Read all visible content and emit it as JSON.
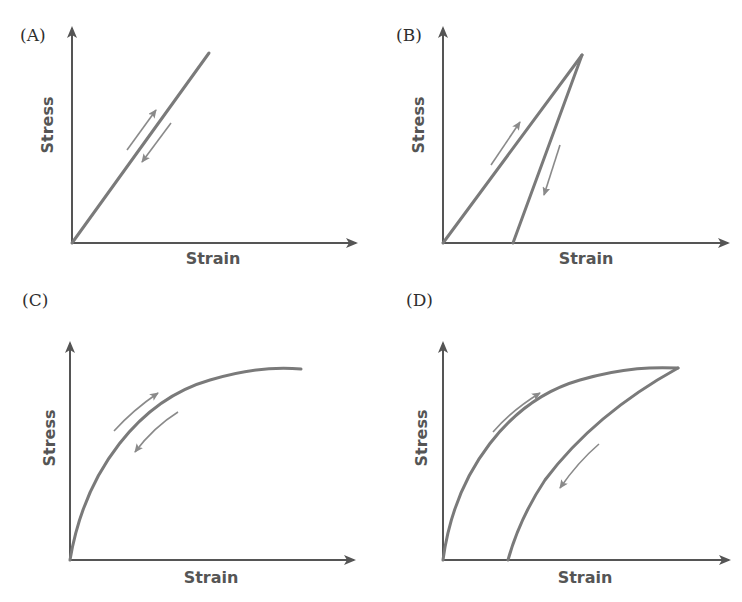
{
  "figure": {
    "panels": [
      {
        "id": "A",
        "label": "(A)",
        "xlabel": "Strain",
        "ylabel": "Stress",
        "description": "Linear elastic: loading and unloading follow the same straight line"
      },
      {
        "id": "B",
        "label": "(B)",
        "xlabel": "Strain",
        "ylabel": "Stress",
        "description": "Linear loading, steeper linear unloading with residual strain"
      },
      {
        "id": "C",
        "label": "(C)",
        "xlabel": "Strain",
        "ylabel": "Stress",
        "description": "Nonlinear elastic: loading and unloading follow the same curve"
      },
      {
        "id": "D",
        "label": "(D)",
        "xlabel": "Strain",
        "ylabel": "Stress",
        "description": "Nonlinear loading, different unloading curve with residual strain (hysteresis)"
      }
    ]
  },
  "colors": {
    "axis": "#555555",
    "curve": "#7a7a7a",
    "arrow": "#8a8a8a",
    "text": "#2e2e2e"
  }
}
